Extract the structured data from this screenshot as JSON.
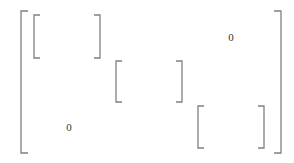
{
  "diagram": {
    "type": "block-diagonal-matrix",
    "stroke_color": "#808080",
    "text_color": "#333333",
    "outer_matrix": {
      "left": 21,
      "right": 281,
      "top": 11,
      "bottom": 153,
      "serif": 7
    },
    "blocks": [
      {
        "id": "block-1",
        "left": 34,
        "right": 100,
        "top": 15,
        "bottom": 58,
        "serif": 6
      },
      {
        "id": "block-2",
        "left": 116,
        "right": 182,
        "top": 61,
        "bottom": 102,
        "serif": 6
      },
      {
        "id": "block-3",
        "left": 198,
        "right": 264,
        "top": 106,
        "bottom": 148,
        "serif": 6
      }
    ],
    "labels": [
      {
        "id": "upper-zero",
        "text": "0",
        "x": 231,
        "y": 41
      },
      {
        "id": "lower-zero",
        "text": "0",
        "x": 69,
        "y": 131
      }
    ]
  }
}
